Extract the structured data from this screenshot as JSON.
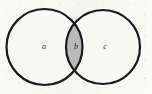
{
  "figure": {
    "kind": "venn-diagram",
    "width": 152,
    "height": 94,
    "background_color": "#f7f7f5",
    "stroke_color": "#1a1a1a",
    "stroke_width": 2.2,
    "intersection_fill": "#b9b9b9",
    "circle_fill": "#f7f7f5",
    "label_color": "#2b2b2b"
  },
  "circles": [
    {
      "id": "left-circle",
      "label": "a",
      "center_x": 44.5,
      "center_y": 47,
      "radius": 38,
      "label_x": 44,
      "label_y": 47
    },
    {
      "id": "right-circle",
      "label": "c",
      "center_x": 103,
      "center_y": 47,
      "radius": 37,
      "label_x": 105,
      "label_y": 47
    }
  ],
  "intersection": {
    "id": "lens-region",
    "label": "b",
    "label_x": 76,
    "label_y": 47,
    "shaded": true,
    "fill": "#b9b9b9",
    "left_x": 66,
    "right_x": 83,
    "top_y": 21,
    "bottom_y": 73
  },
  "labels": {
    "a": "a",
    "b": "b",
    "c": "c"
  }
}
